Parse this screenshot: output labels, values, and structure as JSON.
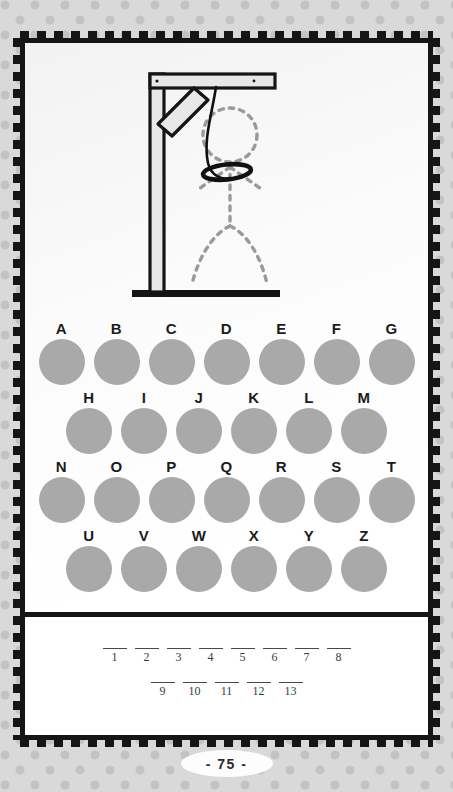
{
  "page": {
    "page_number_label": "- 75 -",
    "background_color": "#d9d9d9",
    "dot_color": "#c3c3c3",
    "frame_color": "#151515",
    "card_color": "#ffffff"
  },
  "gallows": {
    "icon_name": "gallows-illustration",
    "wood_fill": "#e8e8e8",
    "wood_outline": "#151515",
    "rope_color": "#111111",
    "figure_dash_color": "#9a9a9a",
    "parts": [
      "base-beam",
      "vertical-post",
      "top-beam",
      "diagonal-brace",
      "rope",
      "noose-loop"
    ],
    "victim_outline_parts": [
      "head",
      "torso",
      "left-arm",
      "right-arm",
      "left-leg",
      "right-leg"
    ],
    "wrong_guesses": 0
  },
  "alphabet": {
    "disc_color": "#a9a9a9",
    "label_color": "#1b1b1b",
    "rows": [
      {
        "letters": [
          "A",
          "B",
          "C",
          "D",
          "E",
          "F",
          "G"
        ]
      },
      {
        "letters": [
          "H",
          "I",
          "J",
          "K",
          "L",
          "M"
        ]
      },
      {
        "letters": [
          "N",
          "O",
          "P",
          "Q",
          "R",
          "S",
          "T"
        ]
      },
      {
        "letters": [
          "U",
          "V",
          "W",
          "X",
          "Y",
          "Z"
        ]
      }
    ]
  },
  "answer": {
    "line_color": "#4a4a4a",
    "number_color": "#3b3b3b",
    "rows": [
      {
        "slots": [
          {
            "number": "1",
            "letter": ""
          },
          {
            "number": "2",
            "letter": ""
          },
          {
            "number": "3",
            "letter": ""
          },
          {
            "number": "4",
            "letter": ""
          },
          {
            "number": "5",
            "letter": ""
          },
          {
            "number": "6",
            "letter": ""
          },
          {
            "number": "7",
            "letter": ""
          },
          {
            "number": "8",
            "letter": ""
          }
        ]
      },
      {
        "slots": [
          {
            "number": "9",
            "letter": ""
          },
          {
            "number": "10",
            "letter": ""
          },
          {
            "number": "11",
            "letter": ""
          },
          {
            "number": "12",
            "letter": ""
          },
          {
            "number": "13",
            "letter": ""
          }
        ]
      }
    ]
  }
}
